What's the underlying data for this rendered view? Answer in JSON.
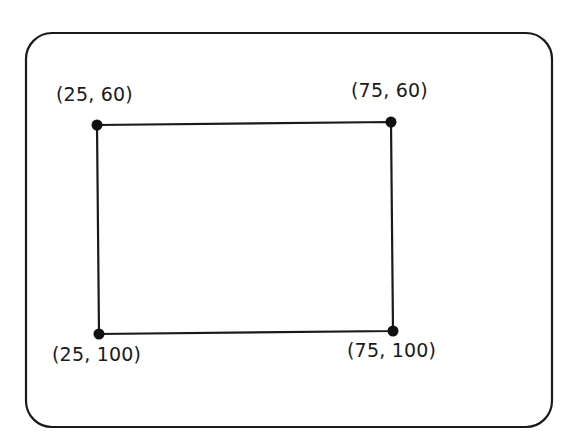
{
  "diagram": {
    "type": "rectangle-with-labeled-corners",
    "colors": {
      "stroke": "#1a1a1a",
      "background": "#ffffff"
    },
    "frame": {
      "x": 26,
      "y": 33,
      "width": 526,
      "height": 394,
      "radius": 26
    },
    "points": [
      {
        "id": "top-left",
        "label": "(25, 60)",
        "px": 97,
        "py": 125,
        "label_x": 52,
        "label_y": 86
      },
      {
        "id": "top-right",
        "label": "(75, 60)",
        "px": 391,
        "py": 122,
        "label_x": 352,
        "label_y": 82
      },
      {
        "id": "bottom-left",
        "label": "(25, 100)",
        "px": 99,
        "py": 334,
        "label_x": 53,
        "label_y": 345
      },
      {
        "id": "bottom-right",
        "label": "(75, 100)",
        "px": 393,
        "py": 331,
        "label_x": 348,
        "label_y": 342
      }
    ]
  }
}
